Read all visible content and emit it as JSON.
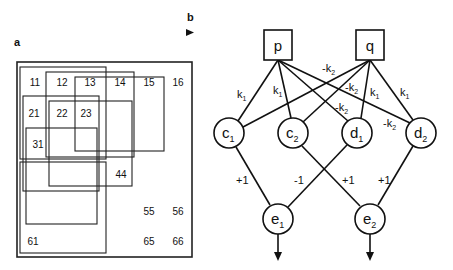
{
  "panel_a": {
    "label": "a",
    "cells": [
      {
        "text": "11",
        "x": 35,
        "y": 86
      },
      {
        "text": "12",
        "x": 62,
        "y": 86
      },
      {
        "text": "13",
        "x": 90,
        "y": 86
      },
      {
        "text": "14",
        "x": 120,
        "y": 86
      },
      {
        "text": "15",
        "x": 149,
        "y": 86
      },
      {
        "text": "16",
        "x": 178,
        "y": 86
      },
      {
        "text": "21",
        "x": 34,
        "y": 117
      },
      {
        "text": "22",
        "x": 62,
        "y": 117
      },
      {
        "text": "23",
        "x": 86,
        "y": 117
      },
      {
        "text": "31",
        "x": 38,
        "y": 148
      },
      {
        "text": "44",
        "x": 121,
        "y": 178
      },
      {
        "text": "55",
        "x": 149,
        "y": 215
      },
      {
        "text": "56",
        "x": 178,
        "y": 215
      },
      {
        "text": "61",
        "x": 33,
        "y": 245
      },
      {
        "text": "65",
        "x": 149,
        "y": 245
      },
      {
        "text": "66",
        "x": 178,
        "y": 245
      }
    ]
  },
  "panel_b": {
    "label": "b",
    "inputs": [
      {
        "id": "p",
        "label": "p"
      },
      {
        "id": "q",
        "label": "q"
      }
    ],
    "hidden": [
      {
        "id": "c1",
        "main": "c",
        "sub": "1"
      },
      {
        "id": "c2",
        "main": "c",
        "sub": "2"
      },
      {
        "id": "d1",
        "main": "d",
        "sub": "1"
      },
      {
        "id": "d2",
        "main": "d",
        "sub": "2"
      }
    ],
    "outputs": [
      {
        "id": "e1",
        "main": "e",
        "sub": "1"
      },
      {
        "id": "e2",
        "main": "e",
        "sub": "2"
      }
    ],
    "weights": {
      "k1_main": "k",
      "k1_sub": "1",
      "neg_k2_main": "-k",
      "neg_k2_sub": "2",
      "plus1": "+1",
      "minus1": "-1"
    }
  }
}
